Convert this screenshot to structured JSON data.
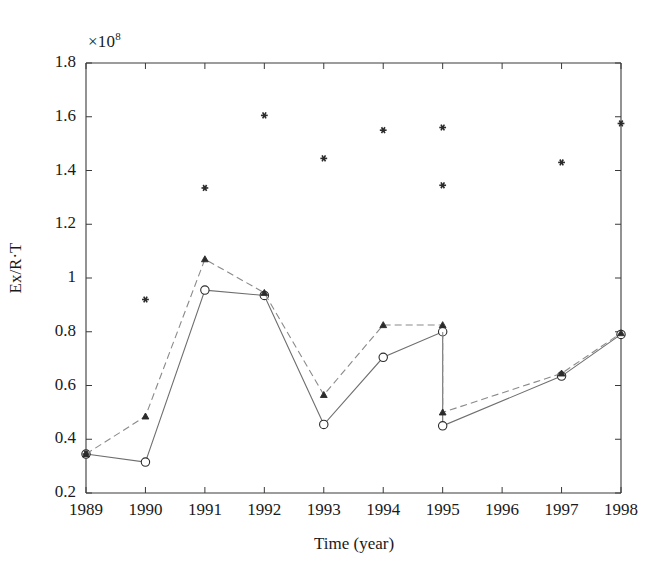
{
  "chart_data": {
    "type": "line",
    "title": "",
    "xlabel": "Time (year)",
    "ylabel": "Ex/R·T",
    "y_multiplier": "×10",
    "y_multiplier_exp": "8",
    "x_categories": [
      "1989",
      "1990",
      "1991",
      "1992",
      "1993",
      "1994",
      "1995",
      "1996",
      "1997",
      "1998"
    ],
    "xlim": [
      1989,
      1998
    ],
    "ylim": [
      0.2,
      1.8
    ],
    "y_ticks": [
      "0.2",
      "0.4",
      "0.6",
      "0.8",
      "1",
      "1.2",
      "1.4",
      "1.6",
      "1.8"
    ],
    "y_tick_values": [
      0.2,
      0.4,
      0.6,
      0.8,
      1.0,
      1.2,
      1.4,
      1.6,
      1.8
    ],
    "grid": false,
    "legend": "none",
    "series": [
      {
        "name": "solid-open-circle",
        "style": "solid",
        "marker": "open-circle",
        "x": [
          1989,
          1990,
          1991,
          1992,
          1993,
          1994,
          1995,
          1995,
          1997,
          1998
        ],
        "values": [
          0.345,
          0.315,
          0.955,
          0.935,
          0.455,
          0.705,
          0.8,
          0.45,
          0.635,
          0.79
        ]
      },
      {
        "name": "dashed-filled-marker",
        "style": "dashed",
        "marker": "filled",
        "x": [
          1989,
          1990,
          1991,
          1992,
          1993,
          1994,
          1995,
          1995,
          1997,
          1998
        ],
        "values": [
          0.345,
          0.485,
          1.07,
          0.945,
          0.565,
          0.825,
          0.825,
          0.5,
          0.645,
          0.795
        ]
      },
      {
        "name": "scatter-asterisk",
        "style": "none",
        "marker": "asterisk",
        "x": [
          1989,
          1990,
          1991,
          1992,
          1993,
          1994,
          1995,
          1995,
          1997,
          1998
        ],
        "values": [
          0.345,
          0.92,
          1.335,
          1.605,
          1.445,
          1.55,
          1.56,
          1.345,
          1.43,
          1.575
        ]
      }
    ],
    "colors": {
      "axis": "#3a3a3a",
      "solid_line": "#6e6e6e",
      "dashed_line": "#8a8a8a",
      "marker": "#2b2b2b",
      "background": "#ffffff"
    }
  }
}
